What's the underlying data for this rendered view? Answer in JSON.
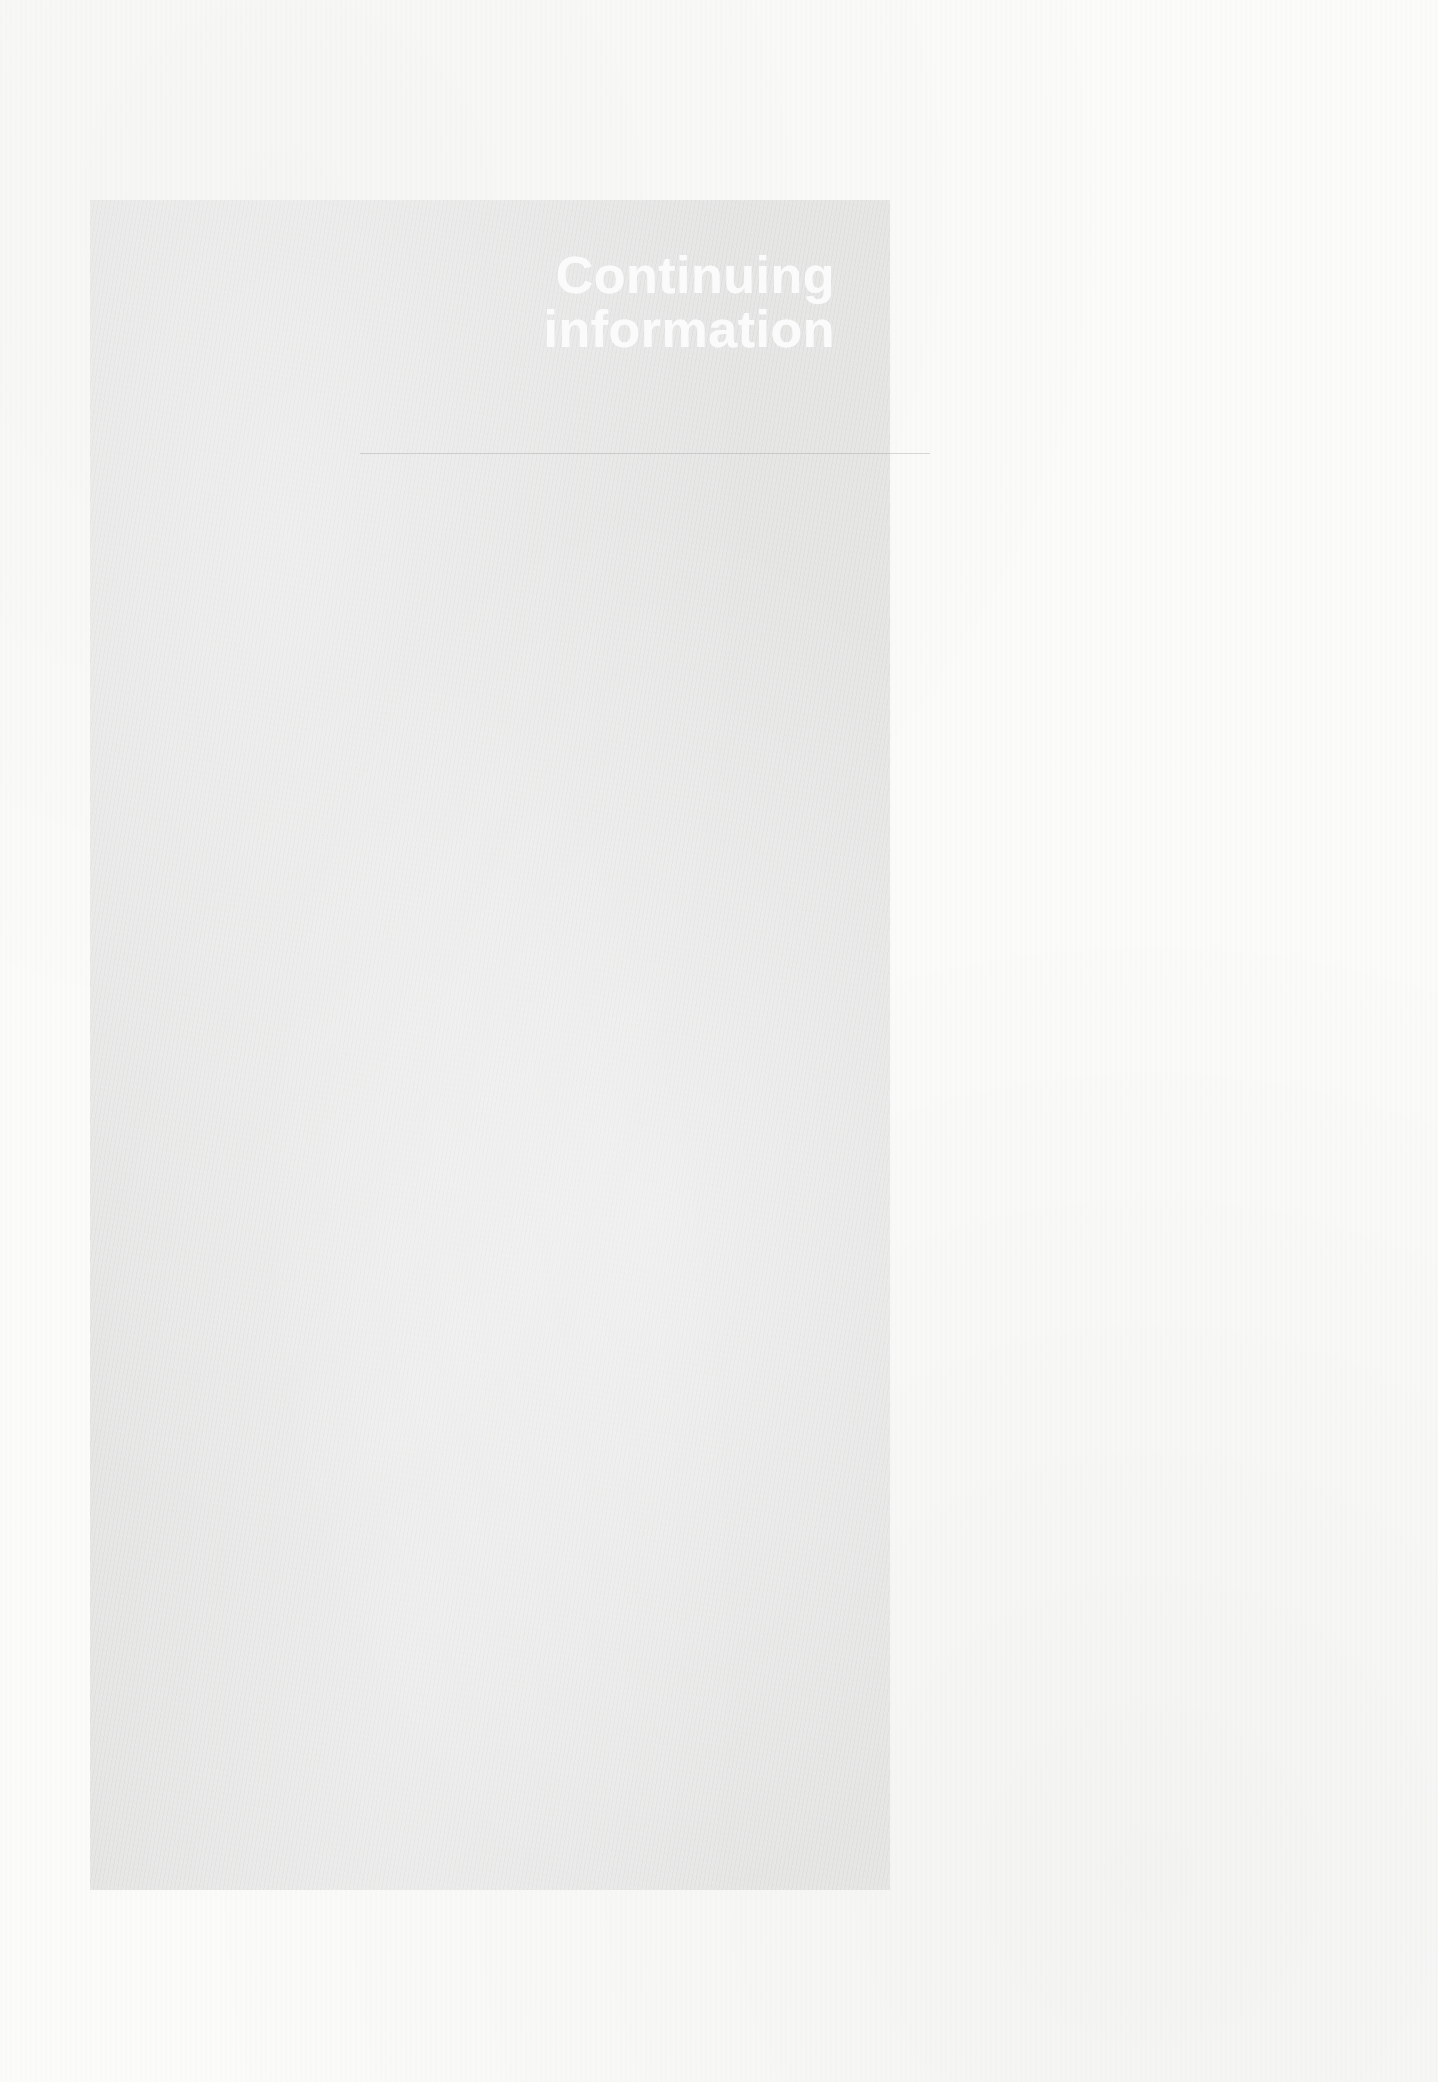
{
  "document": {
    "panel": {
      "title_lines": [
        "Continuing",
        "information"
      ],
      "background_color": "#e6e6e5",
      "text_color": "#ffffff"
    },
    "page_background_color": "#fbfbfa"
  }
}
